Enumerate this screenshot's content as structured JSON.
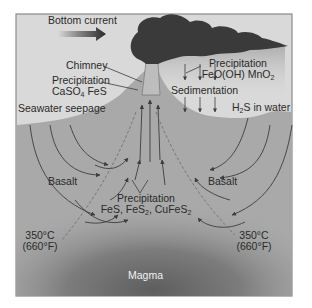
{
  "diagram": {
    "type": "hydrothermal-vent-cross-section",
    "labels": {
      "bottom_current": "Bottom current",
      "chimney": "Chimney",
      "precip_chimney_title": "Precipitation",
      "precip_chimney_minerals": [
        "CaSO",
        "4",
        " FeS"
      ],
      "seawater_seepage": "Seawater seepage",
      "precip_plume_title": "Precipitation",
      "precip_plume_minerals": [
        "FeO(OH) MnO",
        "2"
      ],
      "sedimentation": "Sedimentation",
      "h2s": [
        "H",
        "2",
        "S in water"
      ],
      "basalt_left": "Basalt",
      "basalt_right": "Basalt",
      "precip_deep_title": "Precipitation",
      "precip_deep_minerals": [
        "FeS, FeS",
        "2",
        ", CuFeS",
        "2"
      ],
      "temp_left": "350°C",
      "temp_left_f": "(660°F)",
      "temp_right": "350°C",
      "temp_right_f": "(660°F)",
      "magma": "Magma"
    },
    "colors": {
      "water": "#d9d9d9",
      "seafloor": "#a9a9a9",
      "plume": "#3a3a3a",
      "magma_core": "#6a6a6a",
      "arrow": "#3c3c3c",
      "frame": "#8a8a8a"
    }
  }
}
